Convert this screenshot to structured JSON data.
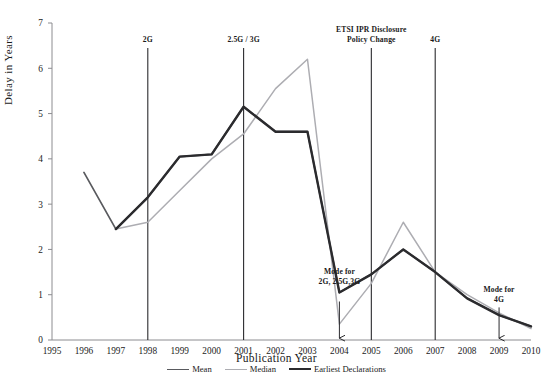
{
  "chart_data": {
    "type": "line",
    "title": "",
    "xlabel": "Publication Year",
    "ylabel": "Delay in Years",
    "xlim": [
      1995,
      2010
    ],
    "ylim": [
      0,
      7
    ],
    "yticks": [
      0,
      1,
      2,
      3,
      4,
      5,
      6,
      7
    ],
    "grid": false,
    "legend_position": "bottom",
    "x": [
      1995,
      1996,
      1997,
      1998,
      1999,
      2000,
      2001,
      2002,
      2003,
      2004,
      2005,
      2006,
      2007,
      2008,
      2009,
      2010
    ],
    "categories": [
      "1995",
      "1996",
      "1997",
      "1998",
      "1999",
      "2000",
      "2001",
      "2002",
      "2003",
      "2004",
      "2005",
      "2006",
      "2007",
      "2008",
      "2009",
      "2010"
    ],
    "series": [
      {
        "name": "Mean",
        "color": "#595a5e",
        "width": 1.7,
        "x": [
          1996,
          1997,
          1998,
          1999,
          2000,
          2001,
          2002,
          2003,
          2004,
          2005,
          2006,
          2007,
          2008,
          2009,
          2010
        ],
        "values": [
          3.7,
          2.45,
          3.15,
          4.05,
          4.1,
          5.15,
          4.6,
          4.6,
          1.05,
          1.45,
          2.0,
          1.5,
          0.92,
          0.55,
          0.3
        ]
      },
      {
        "name": "Median",
        "color": "#adadb2",
        "width": 1.5,
        "x": [
          1997,
          1998,
          1999,
          2000,
          2001,
          2002,
          2003,
          2004,
          2005,
          2006,
          2007,
          2008,
          2009,
          2010
        ],
        "values": [
          2.45,
          2.6,
          3.3,
          4.0,
          4.55,
          5.55,
          6.2,
          0.35,
          1.25,
          2.6,
          1.5,
          1.0,
          0.6,
          0.25
        ]
      },
      {
        "name": "Earliest Declarations",
        "color": "#2b2b2e",
        "width": 2.4,
        "x": [
          1997,
          1998,
          1999,
          2000,
          2001,
          2002,
          2003,
          2004,
          2005,
          2006,
          2007,
          2008,
          2009,
          2010
        ],
        "values": [
          2.45,
          3.15,
          4.05,
          4.1,
          5.15,
          4.6,
          4.6,
          1.05,
          1.45,
          2.0,
          1.5,
          0.92,
          0.55,
          0.3
        ]
      }
    ],
    "markers": [
      {
        "label": "2G",
        "x": 1998,
        "y_top": 6.45,
        "label_lines": [
          "2G"
        ]
      },
      {
        "label": "2.5G / 3G",
        "x": 2001,
        "y_top": 6.45,
        "label_lines": [
          "2.5G / 3G"
        ]
      },
      {
        "label": "ETSI IPR Disclosure Policy Change",
        "x": 2005,
        "y_top": 6.45,
        "label_lines": [
          "ETSI IPR Disclosure",
          "Policy Change"
        ]
      },
      {
        "label": "4G",
        "x": 2007,
        "y_top": 6.45,
        "label_lines": [
          "4G"
        ]
      }
    ],
    "annotations": [
      {
        "text_lines": [
          "Mode for",
          "2G, 2.5G,3G"
        ],
        "x": 2004,
        "text_y": 1.45,
        "arrow_from_y": 0.85,
        "arrow_to_y": 0.04
      },
      {
        "text_lines": [
          "Mode for",
          "4G"
        ],
        "x": 2009,
        "text_y": 1.05,
        "arrow_from_y": 0.72,
        "arrow_to_y": 0.04
      }
    ]
  },
  "caption": ""
}
